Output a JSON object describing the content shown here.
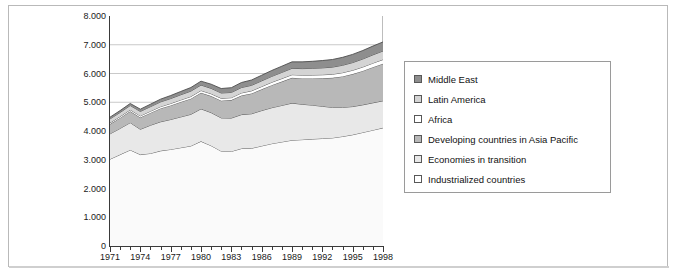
{
  "chart_data": {
    "type": "area",
    "title": "",
    "subtitle": "",
    "xlabel": "",
    "ylabel": "Carbon Dioxide Emissions (MtC)",
    "xlim": [
      1971,
      1998
    ],
    "ylim": [
      0,
      8000
    ],
    "y_tick_labels": [
      "0",
      "1.000",
      "2.000",
      "3.000",
      "4.000",
      "5.000",
      "6.000",
      "7.000",
      "8.000"
    ],
    "y_tick_values": [
      0,
      1000,
      2000,
      3000,
      4000,
      5000,
      6000,
      7000,
      8000
    ],
    "x_tick_labels": [
      "1971",
      "1974",
      "1977",
      "1980",
      "1983",
      "1986",
      "1989",
      "1992",
      "1995",
      "1998"
    ],
    "x_tick_values": [
      1971,
      1974,
      1977,
      1980,
      1983,
      1986,
      1989,
      1992,
      1995,
      1998
    ],
    "x": [
      1971,
      1972,
      1973,
      1974,
      1975,
      1976,
      1977,
      1978,
      1979,
      1980,
      1981,
      1982,
      1983,
      1984,
      1985,
      1986,
      1987,
      1988,
      1989,
      1990,
      1991,
      1992,
      1993,
      1994,
      1995,
      1996,
      1997,
      1998
    ],
    "grid": "horizontal",
    "gridlines": [
      5000,
      6000,
      7000
    ],
    "legend_position": "right",
    "stacked": true,
    "stack_order_bottom_to_top": [
      "Industrialized countries",
      "Economies in transition",
      "Developing countries in Asia Pacific",
      "Africa",
      "Latin America",
      "Middle East"
    ],
    "series": [
      {
        "name": "Middle East",
        "color": "#8e8e8e",
        "values": [
          60,
          65,
          70,
          78,
          85,
          95,
          105,
          115,
          125,
          135,
          145,
          155,
          165,
          175,
          185,
          195,
          205,
          215,
          225,
          235,
          245,
          255,
          265,
          275,
          285,
          295,
          305,
          315
        ]
      },
      {
        "name": "Latin America",
        "color": "#d4d4d4",
        "values": [
          135,
          142,
          150,
          155,
          158,
          165,
          172,
          180,
          188,
          190,
          188,
          185,
          182,
          188,
          192,
          198,
          205,
          215,
          222,
          228,
          232,
          240,
          248,
          258,
          268,
          278,
          288,
          298
        ]
      },
      {
        "name": "Africa",
        "color": "#ffffff",
        "values": [
          45,
          48,
          52,
          56,
          58,
          62,
          66,
          70,
          74,
          78,
          80,
          82,
          84,
          88,
          92,
          96,
          100,
          104,
          108,
          112,
          116,
          120,
          124,
          128,
          132,
          136,
          140,
          145
        ]
      },
      {
        "name": "Developing countries in Asia Pacific",
        "color": "#b8b8b8",
        "values": [
          340,
          365,
          395,
          410,
          430,
          465,
          490,
          520,
          545,
          560,
          575,
          600,
          625,
          665,
          705,
          740,
          785,
          830,
          880,
          900,
          930,
          975,
          1030,
          1080,
          1130,
          1180,
          1240,
          1290
        ]
      },
      {
        "name": "Economies in transition",
        "color": "#e8e8e8",
        "values": [
          880,
          910,
          950,
          880,
          980,
          1010,
          1040,
          1070,
          1100,
          1130,
          1150,
          1155,
          1160,
          1180,
          1200,
          1230,
          1250,
          1270,
          1290,
          1230,
          1180,
          1120,
          1060,
          1010,
          980,
          960,
          950,
          940
        ]
      },
      {
        "name": "Industrialized countries",
        "color": "#fafafa",
        "values": [
          3020,
          3180,
          3340,
          3180,
          3220,
          3310,
          3360,
          3420,
          3480,
          3640,
          3490,
          3300,
          3290,
          3390,
          3400,
          3480,
          3560,
          3620,
          3680,
          3700,
          3720,
          3740,
          3760,
          3810,
          3870,
          3950,
          4030,
          4110
        ]
      }
    ],
    "totals": [
      4480,
      4710,
      4957,
      4759,
      4931,
      5107,
      5233,
      5375,
      5512,
      5733,
      5627,
      5477,
      5506,
      5684,
      5774,
      5939,
      6105,
      6254,
      6405,
      6405,
      6423,
      6450,
      6487,
      6561,
      6665,
      6799,
      6953,
      7098
    ]
  },
  "legend": {
    "items": [
      {
        "label": "Middle East",
        "swatch": "#8e8e8e"
      },
      {
        "label": "Latin America",
        "swatch": "#d4d4d4"
      },
      {
        "label": "Africa",
        "swatch": "#ffffff"
      },
      {
        "label": "Developing countries in Asia Pacific",
        "swatch": "#b8b8b8"
      },
      {
        "label": "Economies in transition",
        "swatch": "#e8e8e8"
      },
      {
        "label": "Industrialized countries",
        "swatch": "#ffffff"
      }
    ]
  }
}
